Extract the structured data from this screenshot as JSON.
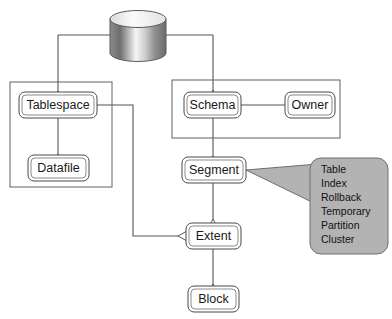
{
  "diagram": {
    "type": "entity-hierarchy-diagram",
    "colors": {
      "background": "#ffffff",
      "node_fill": "#ffffff",
      "node_stroke": "#4a4a4a",
      "connector": "#555555",
      "callout_fill": "#b3b3b3",
      "callout_stroke": "#6e6e6e",
      "text": "#1a1a1a"
    },
    "nodes": [
      {
        "id": "database",
        "label": "",
        "shape": "cylinder"
      },
      {
        "id": "tablespace",
        "label": "Tablespace",
        "shape": "rounded-rect"
      },
      {
        "id": "datafile",
        "label": "Datafile",
        "shape": "rounded-rect"
      },
      {
        "id": "schema",
        "label": "Schema",
        "shape": "rounded-rect"
      },
      {
        "id": "owner",
        "label": "Owner",
        "shape": "rounded-rect"
      },
      {
        "id": "segment",
        "label": "Segment",
        "shape": "rounded-rect"
      },
      {
        "id": "extent",
        "label": "Extent",
        "shape": "rounded-rect"
      },
      {
        "id": "block",
        "label": "Block",
        "shape": "rounded-rect"
      }
    ],
    "groups": [
      {
        "id": "physical-group",
        "label": ""
      },
      {
        "id": "logical-group",
        "label": ""
      }
    ],
    "edges": [
      {
        "from": "database",
        "to": "tablespace",
        "arrow": "hollow-triangle"
      },
      {
        "from": "database",
        "to": "schema",
        "arrow": "hollow-triangle"
      },
      {
        "from": "tablespace",
        "to": "datafile",
        "arrow": "hollow-triangle"
      },
      {
        "from": "schema",
        "to": "owner",
        "arrow": "none"
      },
      {
        "from": "schema",
        "to": "segment",
        "arrow": "hollow-triangle"
      },
      {
        "from": "segment",
        "to": "extent",
        "arrow": "hollow-triangle"
      },
      {
        "from": "extent",
        "to": "block",
        "arrow": "hollow-triangle"
      },
      {
        "from": "tablespace",
        "to": "extent",
        "arrow": "hollow-triangle-left"
      }
    ],
    "callout": {
      "attached_to": "segment",
      "items": [
        "Table",
        "Index",
        "Rollback",
        "Temporary",
        "Partition",
        "Cluster"
      ]
    }
  }
}
